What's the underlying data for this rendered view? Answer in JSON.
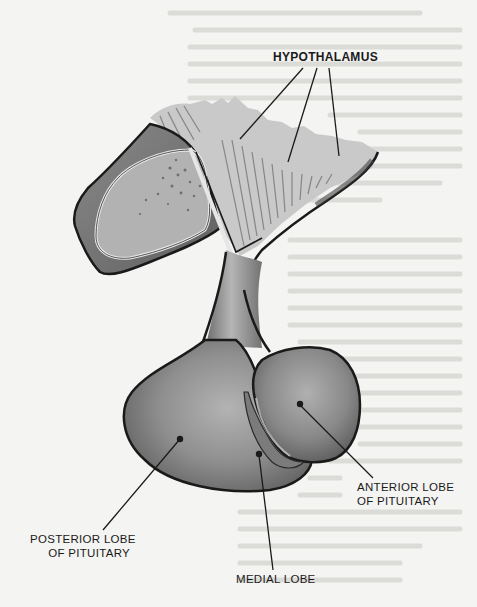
{
  "figure": {
    "colors": {
      "paper": "#f4f4f2",
      "outline": "#1a1a1a",
      "tissue_dark": "#6f6f6f",
      "tissue_mid": "#8e8e8e",
      "tissue_light": "#b9b9b9",
      "hypothalamus_fill": "#c8c8c8"
    },
    "labels": {
      "hypothalamus": "HYPOTHALAMUS",
      "anterior_line1": "ANTERIOR LOBE",
      "anterior_line2": "OF PITUITARY",
      "posterior_line1": "POSTERIOR LOBE",
      "posterior_line2": "OF PITUITARY",
      "medial": "MEDIAL LOBE"
    }
  }
}
